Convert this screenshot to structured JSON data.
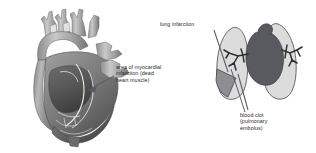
{
  "figure": {
    "background_color": "#ffffff",
    "width": 316,
    "height": 153
  },
  "labels": {
    "myocardial_infarction": "area of myocardial\ninfarction (dead\nheart muscle)",
    "lung_infarction": "lung infarction",
    "blood_clot": "blood clot\n(pulmonary\nembolus)"
  },
  "illustrations": {
    "heart": {
      "name": "heart cutaway",
      "description": "Grayscale cross-sectional heart with aortic arch and great vessels"
    },
    "lungs": {
      "name": "lungs with pulmonary embolus",
      "description": "Pair of light gray lungs with dark central mediastinum, branching pulmonary vessels, and a gray wedge-shaped infarct at the lower left lobe"
    }
  },
  "colors": {
    "text": "#2b2b2b",
    "leader_line": "#5d5d66",
    "heart_light": "#d0d0d0",
    "heart_mid": "#9a9a9a",
    "heart_dark": "#6a6a6a",
    "heart_darkest": "#4a4a4a",
    "lung_fill": "#d9d9d9",
    "lung_outline": "#5a5a5a",
    "mediastinum": "#595960",
    "vessel": "#2e2e33",
    "infarct_wedge": "#8e8e92"
  }
}
